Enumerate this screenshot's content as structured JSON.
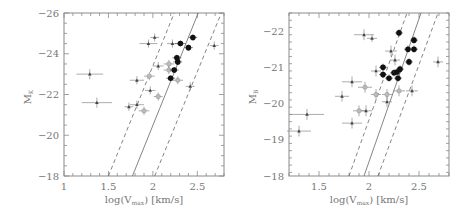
{
  "chart_data": [
    {
      "type": "scatter",
      "title": "",
      "xlabel": "log(V_max) [km/s]",
      "xlabel_main": "log(V",
      "xlabel_sub": "max",
      "xlabel_tail": ") [km/s]",
      "ylabel": "M_K",
      "ylabel_main": "M",
      "ylabel_sub": "K",
      "xlim": [
        1.0,
        2.8
      ],
      "ylim": [
        -18,
        -26
      ],
      "xticks": [
        1,
        1.5,
        2,
        2.5
      ],
      "xtick_labels": [
        "1",
        "1.5",
        "2",
        "2.5"
      ],
      "yticks": [
        -26,
        -24,
        -22,
        -20,
        -18
      ],
      "ytick_labels": [
        "-26",
        "-24",
        "-22",
        "-20",
        "-18"
      ],
      "grid": false,
      "lines": [
        {
          "name": "fit",
          "style": "solid",
          "x": [
            1.77,
            2.51
          ],
          "y": [
            -18,
            -26
          ]
        },
        {
          "name": "lower-bound",
          "style": "dashed",
          "x": [
            1.5,
            2.24
          ],
          "y": [
            -18,
            -26
          ]
        },
        {
          "name": "upper-bound",
          "style": "dashed",
          "x": [
            2.02,
            2.77
          ],
          "y": [
            -18,
            -26
          ]
        }
      ],
      "series": [
        {
          "name": "small-dark",
          "marker": "small-triangle",
          "color": "#444444",
          "points": [
            {
              "x": 1.29,
              "y": -23.0,
              "xerr": 0.15,
              "yerr": 0.25
            },
            {
              "x": 1.37,
              "y": -21.6,
              "xerr": 0.17,
              "yerr": 0.25
            },
            {
              "x": 1.95,
              "y": -24.5,
              "xerr": 0.1,
              "yerr": 0.2
            },
            {
              "x": 2.02,
              "y": -24.8,
              "xerr": 0.05,
              "yerr": 0.2
            },
            {
              "x": 1.82,
              "y": -22.7,
              "xerr": 0.08,
              "yerr": 0.2
            },
            {
              "x": 2.06,
              "y": -23.4,
              "xerr": 0.06,
              "yerr": 0.2
            },
            {
              "x": 1.97,
              "y": -22.2,
              "xerr": 0.06,
              "yerr": 0.2
            },
            {
              "x": 1.73,
              "y": -21.4,
              "xerr": 0.05,
              "yerr": 0.2
            },
            {
              "x": 1.82,
              "y": -21.5,
              "xerr": 0.08,
              "yerr": 0.2
            },
            {
              "x": 2.22,
              "y": -24.5,
              "xerr": 0.06,
              "yerr": 0.2
            },
            {
              "x": 2.42,
              "y": -22.4,
              "xerr": 0.05,
              "yerr": 0.2
            },
            {
              "x": 2.69,
              "y": -24.4,
              "xerr": 0.05,
              "yerr": 0.2
            }
          ]
        },
        {
          "name": "gray",
          "marker": "open-circle",
          "color": "#9a9a9a",
          "points": [
            {
              "x": 1.96,
              "y": -22.9,
              "xerr": 0.06,
              "yerr": 0.2
            },
            {
              "x": 2.06,
              "y": -21.9,
              "xerr": 0.05,
              "yerr": 0.2
            },
            {
              "x": 1.9,
              "y": -21.2,
              "xerr": 0.06,
              "yerr": 0.2
            },
            {
              "x": 2.18,
              "y": -23.5,
              "xerr": 0.06,
              "yerr": 0.2
            },
            {
              "x": 2.18,
              "y": -23.2,
              "xerr": 0.06,
              "yerr": 0.2
            },
            {
              "x": 2.28,
              "y": -22.7,
              "xerr": 0.06,
              "yerr": 0.2
            }
          ]
        },
        {
          "name": "filled-black",
          "marker": "filled-circle",
          "color": "#111111",
          "points": [
            {
              "x": 2.31,
              "y": -24.5,
              "xerr": 0.06,
              "yerr": 0.15
            },
            {
              "x": 2.4,
              "y": -24.3,
              "xerr": 0.05,
              "yerr": 0.15
            },
            {
              "x": 2.45,
              "y": -24.8,
              "xerr": 0.05,
              "yerr": 0.15
            },
            {
              "x": 2.27,
              "y": -23.8,
              "xerr": 0.05,
              "yerr": 0.15
            },
            {
              "x": 2.28,
              "y": -23.6,
              "xerr": 0.05,
              "yerr": 0.15
            },
            {
              "x": 2.24,
              "y": -23.2,
              "xerr": 0.05,
              "yerr": 0.15
            },
            {
              "x": 2.2,
              "y": -22.8,
              "xerr": 0.05,
              "yerr": 0.15
            }
          ]
        }
      ]
    },
    {
      "type": "scatter",
      "title": "",
      "xlabel": "log(V_max) [km/s]",
      "xlabel_main": "log(V",
      "xlabel_sub": "max",
      "xlabel_tail": ") [km/s]",
      "ylabel": "M_B",
      "ylabel_main": "M",
      "ylabel_sub": "B",
      "xlim": [
        1.2,
        2.8
      ],
      "ylim": [
        -18,
        -22.5
      ],
      "xticks": [
        1.5,
        2,
        2.5
      ],
      "xtick_labels": [
        "1.5",
        "2",
        "2.5"
      ],
      "yticks": [
        -22,
        -21,
        -20,
        -19,
        -18
      ],
      "ytick_labels": [
        "-22",
        "-21",
        "-20",
        "-19",
        "-18"
      ],
      "grid": false,
      "lines": [
        {
          "name": "fit",
          "style": "solid",
          "x": [
            1.95,
            2.52
          ],
          "y": [
            -18,
            -22.5
          ]
        },
        {
          "name": "lower-bound",
          "style": "dashed",
          "x": [
            1.8,
            2.38
          ],
          "y": [
            -18,
            -22.5
          ]
        },
        {
          "name": "upper-bound",
          "style": "dashed",
          "x": [
            2.09,
            2.69
          ],
          "y": [
            -18,
            -22.5
          ]
        }
      ],
      "series": [
        {
          "name": "small-dark",
          "marker": "small-triangle",
          "color": "#444444",
          "points": [
            {
              "x": 1.3,
              "y": -19.24,
              "xerr": 0.12,
              "yerr": 0.15
            },
            {
              "x": 1.38,
              "y": -19.7,
              "xerr": 0.17,
              "yerr": 0.15
            },
            {
              "x": 1.83,
              "y": -19.46,
              "xerr": 0.1,
              "yerr": 0.15
            },
            {
              "x": 1.73,
              "y": -20.2,
              "xerr": 0.07,
              "yerr": 0.15
            },
            {
              "x": 1.83,
              "y": -20.6,
              "xerr": 0.1,
              "yerr": 0.15
            },
            {
              "x": 1.97,
              "y": -19.8,
              "xerr": 0.06,
              "yerr": 0.15
            },
            {
              "x": 1.95,
              "y": -21.9,
              "xerr": 0.1,
              "yerr": 0.15
            },
            {
              "x": 2.03,
              "y": -21.8,
              "xerr": 0.05,
              "yerr": 0.1
            },
            {
              "x": 2.07,
              "y": -20.9,
              "xerr": 0.05,
              "yerr": 0.15
            },
            {
              "x": 2.18,
              "y": -20.05,
              "xerr": 0.05,
              "yerr": 0.15
            },
            {
              "x": 2.22,
              "y": -21.45,
              "xerr": 0.06,
              "yerr": 0.15
            },
            {
              "x": 2.26,
              "y": -21.2,
              "xerr": 0.05,
              "yerr": 0.15
            },
            {
              "x": 2.43,
              "y": -20.35,
              "xerr": 0.06,
              "yerr": 0.15
            },
            {
              "x": 2.69,
              "y": -21.15,
              "xerr": 0.05,
              "yerr": 0.15
            }
          ]
        },
        {
          "name": "gray",
          "marker": "open-circle",
          "color": "#9a9a9a",
          "points": [
            {
              "x": 1.96,
              "y": -20.45,
              "xerr": 0.07,
              "yerr": 0.15
            },
            {
              "x": 1.9,
              "y": -19.8,
              "xerr": 0.06,
              "yerr": 0.15
            },
            {
              "x": 2.07,
              "y": -20.25,
              "xerr": 0.05,
              "yerr": 0.15
            },
            {
              "x": 2.18,
              "y": -20.25,
              "xerr": 0.05,
              "yerr": 0.15
            },
            {
              "x": 2.3,
              "y": -20.35,
              "xerr": 0.06,
              "yerr": 0.15
            }
          ]
        },
        {
          "name": "filled-black",
          "marker": "filled-circle",
          "color": "#111111",
          "points": [
            {
              "x": 2.3,
              "y": -21.95,
              "xerr": 0.04,
              "yerr": 0.1
            },
            {
              "x": 2.14,
              "y": -21.0,
              "xerr": 0.04,
              "yerr": 0.1
            },
            {
              "x": 2.14,
              "y": -20.8,
              "xerr": 0.04,
              "yerr": 0.1
            },
            {
              "x": 2.2,
              "y": -20.7,
              "xerr": 0.04,
              "yerr": 0.1
            },
            {
              "x": 2.25,
              "y": -20.85,
              "xerr": 0.04,
              "yerr": 0.1
            },
            {
              "x": 2.28,
              "y": -20.87,
              "xerr": 0.04,
              "yerr": 0.1
            },
            {
              "x": 2.31,
              "y": -20.95,
              "xerr": 0.04,
              "yerr": 0.1
            },
            {
              "x": 2.29,
              "y": -20.7,
              "xerr": 0.04,
              "yerr": 0.1
            },
            {
              "x": 2.39,
              "y": -21.5,
              "xerr": 0.04,
              "yerr": 0.1
            },
            {
              "x": 2.4,
              "y": -21.15,
              "xerr": 0.04,
              "yerr": 0.1
            },
            {
              "x": 2.45,
              "y": -21.5,
              "xerr": 0.04,
              "yerr": 0.1
            },
            {
              "x": 2.45,
              "y": -21.75,
              "xerr": 0.04,
              "yerr": 0.1
            }
          ]
        }
      ]
    }
  ],
  "layout": {
    "panels": [
      {
        "left": 64,
        "top": 13,
        "right": 224,
        "bottom": 176,
        "ylabel_x": 31,
        "ylabel_y": 97
      },
      {
        "left": 289,
        "top": 13,
        "right": 449,
        "bottom": 176,
        "ylabel_x": 256,
        "ylabel_y": 97
      }
    ]
  }
}
